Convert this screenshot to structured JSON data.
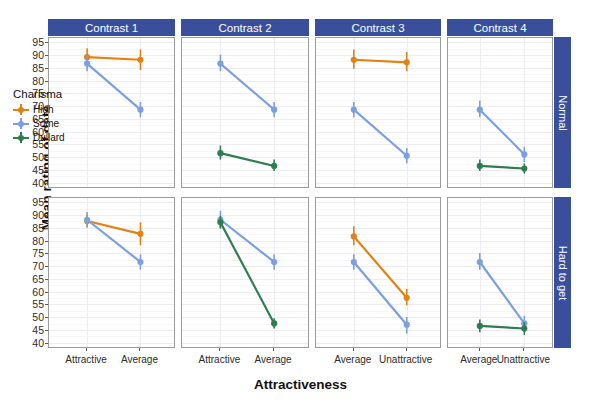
{
  "chart_data": {
    "type": "line",
    "title": "",
    "xlabel": "Attractiveness",
    "ylabel": "Mean rating of date",
    "ylim": [
      38,
      97
    ],
    "yticks": [
      40,
      45,
      50,
      55,
      60,
      65,
      70,
      75,
      80,
      85,
      90,
      95
    ],
    "grid": true,
    "legend_position": "inside-bottom-left-panel",
    "legend_title": "Charisma",
    "series_names": [
      "High",
      "Some",
      "Dullard"
    ],
    "series_colors": [
      "#e08214",
      "#7b9fe0",
      "#2e7d4f"
    ],
    "col_facets": [
      "Contrast 1",
      "Contrast 2",
      "Contrast 3",
      "Contrast 4"
    ],
    "row_facets": [
      "Normal",
      "Hard to get"
    ],
    "panels": [
      {
        "row": "Normal",
        "col": "Contrast 1",
        "categories": [
          "Attractive",
          "Average"
        ],
        "series": [
          {
            "name": "High",
            "values": [
              89.5,
              88.5
            ],
            "err_low": [
              86.0,
              84.5
            ],
            "err_high": [
              93.0,
              92.5
            ]
          },
          {
            "name": "Some",
            "values": [
              87.0,
              69.0
            ],
            "err_low": [
              84.0,
              66.0
            ],
            "err_high": [
              90.0,
              72.0
            ]
          }
        ]
      },
      {
        "row": "Normal",
        "col": "Contrast 2",
        "categories": [
          "Attractive",
          "Average"
        ],
        "series": [
          {
            "name": "Some",
            "values": [
              87.0,
              69.0
            ],
            "err_low": [
              84.0,
              66.0
            ],
            "err_high": [
              90.5,
              72.0
            ]
          },
          {
            "name": "Dullard",
            "values": [
              52.0,
              47.0
            ],
            "err_low": [
              49.5,
              45.0
            ],
            "err_high": [
              55.0,
              49.5
            ]
          }
        ]
      },
      {
        "row": "Normal",
        "col": "Contrast 3",
        "categories": [
          "Average",
          "Unattractive"
        ],
        "series": [
          {
            "name": "High",
            "values": [
              88.5,
              87.5
            ],
            "err_low": [
              85.0,
              84.0
            ],
            "err_high": [
              92.5,
              91.5
            ]
          },
          {
            "name": "Some",
            "values": [
              69.0,
              51.0
            ],
            "err_low": [
              66.0,
              48.0
            ],
            "err_high": [
              72.0,
              54.0
            ]
          }
        ]
      },
      {
        "row": "Normal",
        "col": "Contrast 4",
        "categories": [
          "Average",
          "Unattractive"
        ],
        "series": [
          {
            "name": "Some",
            "values": [
              69.0,
              51.5
            ],
            "err_low": [
              66.0,
              48.5
            ],
            "err_high": [
              72.5,
              54.5
            ]
          },
          {
            "name": "Dullard",
            "values": [
              47.0,
              46.0
            ],
            "err_low": [
              45.0,
              44.0
            ],
            "err_high": [
              49.5,
              48.0
            ]
          }
        ]
      },
      {
        "row": "Hard to get",
        "col": "Contrast 1",
        "categories": [
          "Attractive",
          "Average"
        ],
        "series": [
          {
            "name": "High",
            "values": [
              88.0,
              83.0
            ],
            "err_low": [
              85.5,
              78.5
            ],
            "err_high": [
              90.5,
              87.5
            ]
          },
          {
            "name": "Some",
            "values": [
              88.5,
              72.0
            ],
            "err_low": [
              85.5,
              69.0
            ],
            "err_high": [
              91.5,
              75.0
            ]
          }
        ]
      },
      {
        "row": "Hard to get",
        "col": "Contrast 2",
        "categories": [
          "Attractive",
          "Average"
        ],
        "series": [
          {
            "name": "Some",
            "values": [
              88.5,
              72.0
            ],
            "err_low": [
              85.5,
              69.0
            ],
            "err_high": [
              92.0,
              75.0
            ]
          },
          {
            "name": "Dullard",
            "values": [
              87.5,
              48.0
            ],
            "err_low": [
              85.0,
              46.0
            ],
            "err_high": [
              90.0,
              50.0
            ]
          }
        ]
      },
      {
        "row": "Hard to get",
        "col": "Contrast 3",
        "categories": [
          "Average",
          "Unattractive"
        ],
        "series": [
          {
            "name": "High",
            "values": [
              82.0,
              58.0
            ],
            "err_low": [
              78.5,
              55.0
            ],
            "err_high": [
              86.0,
              61.5
            ]
          },
          {
            "name": "Some",
            "values": [
              72.0,
              47.5
            ],
            "err_low": [
              69.0,
              44.0
            ],
            "err_high": [
              75.0,
              50.5
            ]
          }
        ]
      },
      {
        "row": "Hard to get",
        "col": "Contrast 4",
        "categories": [
          "Average",
          "Unattractive"
        ],
        "series": [
          {
            "name": "Some",
            "values": [
              72.0,
              48.0
            ],
            "err_low": [
              69.0,
              45.0
            ],
            "err_high": [
              75.5,
              51.0
            ]
          },
          {
            "name": "Dullard",
            "values": [
              47.0,
              46.0
            ],
            "err_low": [
              44.5,
              43.5
            ],
            "err_high": [
              49.5,
              48.5
            ]
          }
        ]
      }
    ]
  },
  "axes": {
    "y_title": "Mean rating of date",
    "x_title": "Attractiveness",
    "y_tick_labels": [
      "95",
      "90",
      "85",
      "80",
      "75",
      "70",
      "65",
      "60",
      "55",
      "50",
      "45",
      "40"
    ]
  },
  "legend": {
    "title": "Charisma",
    "items": [
      {
        "label": "High",
        "color": "#e08214"
      },
      {
        "label": "Some",
        "color": "#7b9fe0"
      },
      {
        "label": "Dullard",
        "color": "#2e7d4f"
      }
    ]
  },
  "facets": {
    "columns": [
      "Contrast 1",
      "Contrast 2",
      "Contrast 3",
      "Contrast 4"
    ],
    "rows": [
      "Normal",
      "Hard to get"
    ],
    "strip_color": "#3a4f9b",
    "strip_text_color": "#ffffff"
  }
}
